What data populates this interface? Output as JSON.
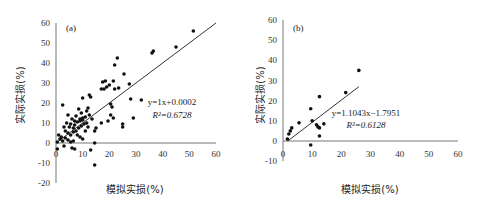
{
  "chart_data": [
    {
      "type": "scatter",
      "panel": "(a)",
      "xlabel": "模拟实损(%)",
      "ylabel": "实际实损(%)",
      "xlim": [
        0,
        60
      ],
      "ylim": [
        -20,
        60
      ],
      "x_ticks": [
        "0",
        "10",
        "20",
        "30",
        "40",
        "50",
        "60"
      ],
      "y_ticks": [
        "-20",
        "-10",
        "0",
        "10",
        "20",
        "30",
        "40",
        "50",
        "60"
      ],
      "grid": false,
      "trendline": {
        "equation": "y=1x+0.0002",
        "r2": "R²=0.6728",
        "slope": 1,
        "intercept": 0.0002,
        "x_range": [
          0,
          60
        ]
      },
      "points": [
        [
          51.5,
          56
        ],
        [
          45,
          48
        ],
        [
          36.5,
          46
        ],
        [
          36,
          45
        ],
        [
          23,
          42.5
        ],
        [
          22,
          39
        ],
        [
          25.5,
          34.5
        ],
        [
          18.5,
          31
        ],
        [
          17.5,
          30.5
        ],
        [
          21.5,
          31
        ],
        [
          27.5,
          29.5
        ],
        [
          19,
          28
        ],
        [
          17,
          27
        ],
        [
          18,
          27
        ],
        [
          22,
          27
        ],
        [
          23.5,
          27.5
        ],
        [
          20,
          29
        ],
        [
          12.5,
          24
        ],
        [
          13,
          23
        ],
        [
          10,
          22.5
        ],
        [
          28,
          22
        ],
        [
          32,
          21.5
        ],
        [
          2.5,
          19
        ],
        [
          20.5,
          19.5
        ],
        [
          21,
          18
        ],
        [
          8.5,
          17
        ],
        [
          12,
          17.5
        ],
        [
          11.5,
          16
        ],
        [
          20.5,
          14
        ],
        [
          29,
          12.5
        ],
        [
          21.5,
          12.5
        ],
        [
          19.5,
          11
        ],
        [
          25,
          9.5
        ],
        [
          25,
          8
        ],
        [
          15,
          7.5
        ],
        [
          14.5,
          6
        ],
        [
          17,
          10
        ],
        [
          4.5,
          14
        ],
        [
          6,
          12
        ],
        [
          7.5,
          13.5
        ],
        [
          9,
          12
        ],
        [
          10,
          11.5
        ],
        [
          11,
          13
        ],
        [
          12.5,
          14
        ],
        [
          13.5,
          12
        ],
        [
          9.5,
          15
        ],
        [
          8,
          10.5
        ],
        [
          7,
          9
        ],
        [
          6.5,
          7.5
        ],
        [
          5,
          8
        ],
        [
          3,
          8
        ],
        [
          3.5,
          6
        ],
        [
          4.5,
          5
        ],
        [
          5.5,
          4
        ],
        [
          6.5,
          5.5
        ],
        [
          7.5,
          6
        ],
        [
          8.5,
          7.5
        ],
        [
          9.5,
          8.5
        ],
        [
          10.5,
          9.5
        ],
        [
          11.5,
          10
        ],
        [
          8,
          4
        ],
        [
          9,
          3
        ],
        [
          10,
          2
        ],
        [
          2,
          3
        ],
        [
          1.5,
          2
        ],
        [
          2.5,
          1
        ],
        [
          3.5,
          2.5
        ],
        [
          4.5,
          1.5
        ],
        [
          5.5,
          0.5
        ],
        [
          6.5,
          1
        ],
        [
          1,
          4
        ],
        [
          0.5,
          0.5
        ],
        [
          3,
          -1.5
        ],
        [
          6,
          -2.5
        ],
        [
          7,
          -3
        ],
        [
          13,
          -3.5
        ],
        [
          14.5,
          0
        ],
        [
          14.5,
          -11
        ],
        [
          0.5,
          -3
        ],
        [
          9,
          11
        ],
        [
          10,
          12.5
        ],
        [
          7,
          11
        ],
        [
          5.5,
          9.5
        ],
        [
          4,
          10
        ],
        [
          11,
          6
        ],
        [
          12,
          8
        ]
      ]
    },
    {
      "type": "scatter",
      "panel": "(b)",
      "xlabel": "模拟实损(%)",
      "ylabel": "实际实损(%)",
      "xlim": [
        0,
        60
      ],
      "ylim": [
        -10,
        60
      ],
      "x_ticks": [
        "0",
        "10",
        "20",
        "30",
        "40",
        "50",
        "60"
      ],
      "y_ticks": [
        "-10",
        "0",
        "10",
        "20",
        "30",
        "40",
        "50",
        "60"
      ],
      "grid": false,
      "trendline": {
        "equation": "y=1.1043x−1.7951",
        "r2": "R²=0.6128",
        "slope": 1.1043,
        "intercept": -1.7951,
        "x_range": [
          1.6,
          26
        ]
      },
      "points": [
        [
          26,
          35
        ],
        [
          21.5,
          24
        ],
        [
          12.5,
          22
        ],
        [
          9.5,
          16
        ],
        [
          10,
          10
        ],
        [
          5.5,
          9
        ],
        [
          3,
          6.5
        ],
        [
          2.5,
          5
        ],
        [
          2,
          3.5
        ],
        [
          1.5,
          1
        ],
        [
          11.5,
          8
        ],
        [
          12,
          7
        ],
        [
          12.5,
          6.5
        ],
        [
          14,
          8.5
        ],
        [
          12.5,
          2.5
        ],
        [
          9.5,
          -2
        ]
      ]
    }
  ]
}
